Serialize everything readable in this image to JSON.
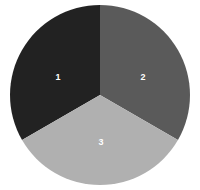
{
  "chart_data": {
    "type": "pie",
    "title": "",
    "subtitle": "",
    "xlabel": "",
    "ylabel": "",
    "categories": [
      "1",
      "2",
      "3"
    ],
    "values": [
      33.3,
      33.3,
      33.4
    ],
    "labels": [
      "1",
      "2",
      "3"
    ],
    "colors": [
      "#222222",
      "#5a5a5a",
      "#b0b0b0"
    ],
    "label_color": "#ffffff",
    "background": "#ffffff",
    "legend": "none",
    "grid": false,
    "start_angle_deg": 0,
    "direction": "clockwise",
    "center": {
      "x": 100,
      "y": 95
    },
    "radius": 90,
    "slices": [
      {
        "label": "1",
        "value": 33.3,
        "color": "#222222",
        "start_deg": 240,
        "end_deg": 360,
        "label_x": 58,
        "label_y": 78
      },
      {
        "label": "2",
        "value": 33.3,
        "color": "#5a5a5a",
        "start_deg": 0,
        "end_deg": 120,
        "label_x": 143,
        "label_y": 78
      },
      {
        "label": "3",
        "value": 33.4,
        "color": "#b0b0b0",
        "start_deg": 120,
        "end_deg": 240,
        "label_x": 101,
        "label_y": 143
      }
    ]
  }
}
